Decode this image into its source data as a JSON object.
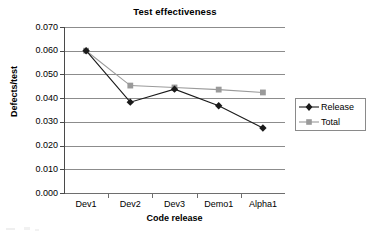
{
  "chart_data": {
    "type": "line",
    "title": "Test effectiveness",
    "xlabel": "Code release",
    "ylabel": "Defects/test",
    "categories": [
      "Dev1",
      "Dev2",
      "Dev3",
      "Demo1",
      "Alpha1"
    ],
    "ylim": [
      0.0,
      0.07
    ],
    "ytick_step": 0.01,
    "ytick_labels": [
      "0.000",
      "0.010",
      "0.020",
      "0.030",
      "0.040",
      "0.050",
      "0.060",
      "0.070"
    ],
    "ytick_values": [
      0.0,
      0.01,
      0.02,
      0.03,
      0.04,
      0.05,
      0.06,
      0.07
    ],
    "grid": "horizontal",
    "legend_position": "right",
    "series": [
      {
        "name": "Release",
        "marker": "diamond",
        "color": "#1a1a1a",
        "values": [
          0.06,
          0.0383,
          0.0438,
          0.0368,
          0.0274
        ]
      },
      {
        "name": "Total",
        "marker": "square",
        "color": "#9a9a9a",
        "values": [
          0.06,
          0.0453,
          0.0445,
          0.0436,
          0.0424
        ]
      }
    ]
  },
  "legend": {
    "items": [
      {
        "label": "Release",
        "marker": "diamond-marker",
        "color": "#1a1a1a"
      },
      {
        "label": "Total",
        "marker": "square-marker",
        "color": "#9a9a9a"
      }
    ]
  },
  "colors": {
    "release": "#1a1a1a",
    "total": "#9a9a9a",
    "gridline": "#8c8c8c",
    "axis": "#4a4a4a",
    "background": "#ffffff"
  }
}
